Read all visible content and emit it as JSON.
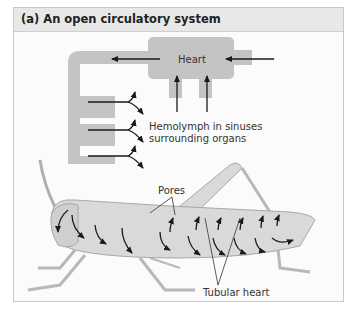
{
  "figure": {
    "title": "(a) An open circulatory system",
    "labels": {
      "heart": "Heart",
      "hemolymph_line1": "Hemolymph in sinuses",
      "hemolymph_line2": "surrounding organs",
      "pores": "Pores",
      "tubular_heart": "Tubular heart"
    },
    "colors": {
      "vessel": "#c4c4c4",
      "arrow": "#1a1a1a",
      "insect_body": "#d9d9d9",
      "insect_outline": "#a8a8a8"
    }
  }
}
